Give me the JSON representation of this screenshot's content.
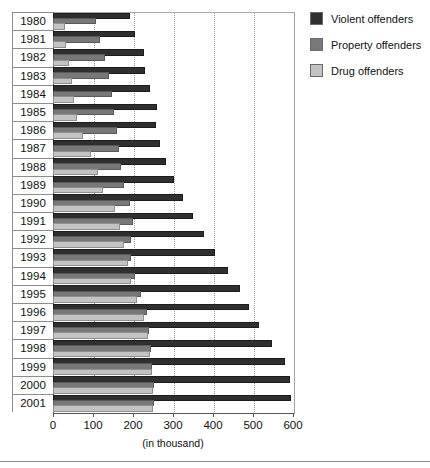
{
  "legend": {
    "position": "right-top",
    "items": [
      {
        "label": "Violent offenders",
        "color": "#2f2f2f",
        "key": "violent"
      },
      {
        "label": "Property offenders",
        "color": "#787878",
        "key": "property"
      },
      {
        "label": "Drug offenders",
        "color": "#c3c3c3",
        "key": "drug"
      }
    ]
  },
  "axis": {
    "x_title": "(in thousand)",
    "ticks": [
      0,
      100,
      200,
      300,
      400,
      500,
      600
    ],
    "tick_labels": [
      "0",
      "100",
      "200",
      "300",
      "400",
      "500",
      "600"
    ]
  },
  "chart_data": {
    "type": "bar",
    "orientation": "horizontal",
    "title": "",
    "subtitle": "",
    "xlabel": "(in thousand)",
    "ylabel": "",
    "xlim": [
      0,
      600
    ],
    "grid": true,
    "legend_position": "right",
    "categories": [
      "1980",
      "1981",
      "1982",
      "1983",
      "1984",
      "1985",
      "1986",
      "1987",
      "1988",
      "1989",
      "1990",
      "1991",
      "1992",
      "1993",
      "1994",
      "1995",
      "1996",
      "1997",
      "1998",
      "1999",
      "2000",
      "2001"
    ],
    "series": [
      {
        "name": "Violent offenders",
        "color": "#2f2f2f",
        "values": [
          187,
          200,
          222,
          225,
          237,
          255,
          252,
          262,
          277,
          297,
          320,
          345,
          372,
          400,
          432,
          462,
          485,
          510,
          542,
          575,
          587,
          590
        ]
      },
      {
        "name": "Property offenders",
        "color": "#787878",
        "values": [
          102,
          112,
          125,
          135,
          142,
          148,
          155,
          160,
          165,
          173,
          188,
          195,
          190,
          190,
          200,
          215,
          230,
          235,
          240,
          243,
          248,
          248
        ]
      },
      {
        "name": "Drug offenders",
        "color": "#c3c3c3",
        "values": [
          25,
          28,
          35,
          42,
          48,
          55,
          70,
          90,
          108,
          120,
          150,
          163,
          173,
          183,
          190,
          205,
          222,
          232,
          238,
          242,
          246,
          246
        ]
      }
    ]
  }
}
